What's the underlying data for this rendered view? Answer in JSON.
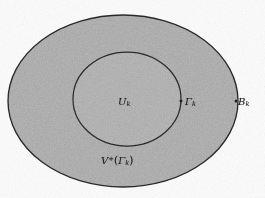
{
  "figure": {
    "kind": "math-set-diagram",
    "caption_labels": {
      "inner_region": {
        "base": "U",
        "subscript": "k"
      },
      "inner_boundary": {
        "base": "Γ",
        "subscript": "k"
      },
      "outer_boundary": {
        "base": "B",
        "subscript": "k"
      },
      "annulus_region": {
        "base": "V",
        "superscript": "+",
        "open_paren": "(",
        "inner": "Γ",
        "inner_subscript": "k",
        "close_paren": ")"
      }
    },
    "colors": {
      "background": "#fdfdfd",
      "shaded_fill": "#b9b9b9",
      "stroke": "#2b2b2b",
      "label_text": "#1d1d1d",
      "marker": "#222222"
    },
    "shapes": {
      "outer_ellipse": {
        "cx": 123,
        "cy": 101,
        "rx": 115,
        "ry": 86,
        "label": "B_k"
      },
      "inner_ellipse": {
        "cx": 127,
        "cy": 99,
        "rx": 54,
        "ry": 47,
        "label": "Gamma_k"
      }
    },
    "markers": [
      {
        "name": "gamma-k-point",
        "cx": 181,
        "cy": 101
      },
      {
        "name": "b-k-point",
        "cx": 236,
        "cy": 101
      }
    ]
  }
}
